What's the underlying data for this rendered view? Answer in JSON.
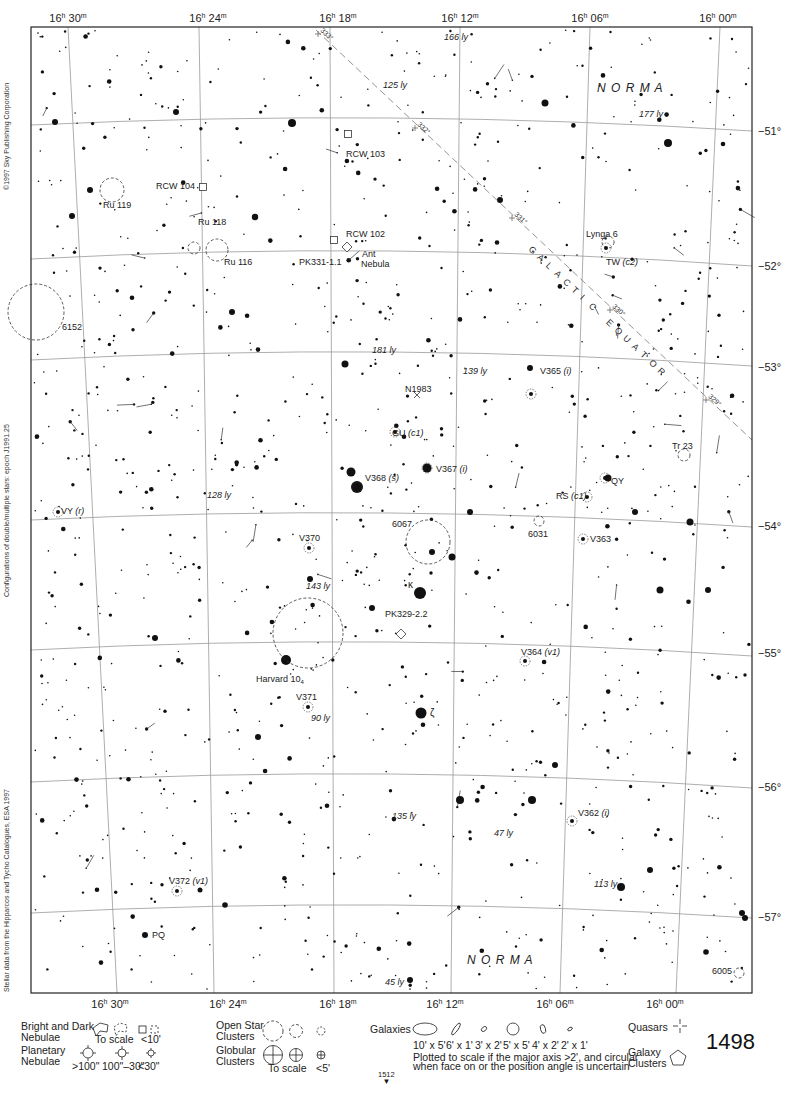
{
  "atlas": {
    "page_number": "1498",
    "adjacent_page_below": "1512",
    "side_notes": [
      "©1997 Sky Publishing Corporation",
      "Configurations of double/multiple stars: epoch J1991.25",
      "Stellar data from the Hipparcos and Tycho Catalogues, ESA 1997"
    ]
  },
  "map": {
    "frame": {
      "left": 31,
      "top": 27,
      "right": 752,
      "bottom": 993
    },
    "ra_labels_top": [
      {
        "h": "16",
        "m": "30",
        "x": 68
      },
      {
        "h": "16",
        "m": "24",
        "x": 208
      },
      {
        "h": "16",
        "m": "18",
        "x": 338
      },
      {
        "h": "16",
        "m": "12",
        "x": 460
      },
      {
        "h": "16",
        "m": "06",
        "x": 590
      },
      {
        "h": "16",
        "m": "00",
        "x": 718
      }
    ],
    "ra_labels_bottom": [
      {
        "h": "16",
        "m": "30",
        "x": 110
      },
      {
        "h": "16",
        "m": "24",
        "x": 228
      },
      {
        "h": "16",
        "m": "18",
        "x": 338
      },
      {
        "h": "16",
        "m": "12",
        "x": 445
      },
      {
        "h": "16",
        "m": "06",
        "x": 555
      },
      {
        "h": "16",
        "m": "00",
        "x": 665
      }
    ],
    "dec_labels": [
      {
        "label": "−51°",
        "y": 131
      },
      {
        "label": "−52°",
        "y": 266
      },
      {
        "label": "−53°",
        "y": 367
      },
      {
        "label": "−54°",
        "y": 526
      },
      {
        "label": "−55°",
        "y": 653
      },
      {
        "label": "−56°",
        "y": 787
      },
      {
        "label": "−57°",
        "y": 917
      }
    ],
    "ra_lines": [
      {
        "x1": 68,
        "y1": 27,
        "x2": 117,
        "y2": 993
      },
      {
        "x1": 199,
        "y1": 27,
        "x2": 214,
        "y2": 993
      },
      {
        "x1": 330,
        "y1": 27,
        "x2": 334,
        "y2": 993
      },
      {
        "x1": 460,
        "y1": 27,
        "x2": 451,
        "y2": 993
      },
      {
        "x1": 590,
        "y1": 27,
        "x2": 560,
        "y2": 993
      },
      {
        "x1": 720,
        "y1": 27,
        "x2": 676,
        "y2": 993
      }
    ],
    "dec_lines": [
      {
        "y_left": 125,
        "y_mid": 118,
        "y_right": 131
      },
      {
        "y_left": 259,
        "y_mid": 251,
        "y_right": 266
      },
      {
        "y_left": 360,
        "y_mid": 352,
        "y_right": 366
      },
      {
        "y_left": 520,
        "y_mid": 513,
        "y_right": 527
      },
      {
        "y_left": 650,
        "y_mid": 642,
        "y_right": 656
      },
      {
        "y_left": 782,
        "y_mid": 774,
        "y_right": 788
      },
      {
        "y_left": 913,
        "y_mid": 905,
        "y_right": 918
      }
    ],
    "galactic_equator": {
      "label": "GALACTIC EQUATOR",
      "x1": 316,
      "y1": 30,
      "x2": 752,
      "y2": 440,
      "ticks": [
        {
          "label": "333°",
          "x": 318,
          "y": 34
        },
        {
          "label": "332°",
          "x": 415,
          "y": 128
        },
        {
          "label": "331°",
          "x": 512,
          "y": 218
        },
        {
          "label": "330°",
          "x": 610,
          "y": 310
        },
        {
          "label": "329°",
          "x": 706,
          "y": 400
        }
      ]
    },
    "constellation_labels": [
      {
        "text": "N O R M A",
        "x": 597,
        "y": 92
      },
      {
        "text": "N O R M A",
        "x": 467,
        "y": 964
      }
    ],
    "objects": [
      {
        "type": "open-cluster",
        "name": "Ru 119",
        "x": 112,
        "y": 190,
        "r": 12,
        "lx": 103,
        "ly": 208
      },
      {
        "type": "bright-nebula",
        "name": "RCW 104",
        "x": 203,
        "y": 187,
        "lx": 156,
        "ly": 189
      },
      {
        "type": "bright-nebula",
        "name": "RCW 103",
        "x": 348,
        "y": 134,
        "lx": 346,
        "ly": 157
      },
      {
        "type": "bright-nebula",
        "name": "RCW 102",
        "x": 334,
        "y": 240,
        "lx": 346,
        "ly": 237
      },
      {
        "type": "open-cluster",
        "name": "Ru 118",
        "x": 194,
        "y": 248,
        "r": 6,
        "lx": 198,
        "ly": 225
      },
      {
        "type": "open-cluster",
        "name": "Ru 116",
        "x": 217,
        "y": 250,
        "r": 11,
        "lx": 224,
        "ly": 265
      },
      {
        "type": "planetary-nebula",
        "name": "PK331-1.1",
        "x": 347,
        "y": 247,
        "lx": 299,
        "ly": 265
      },
      {
        "type": "label",
        "name": "Ant",
        "x": 362,
        "y": 257,
        "lx": 362,
        "ly": 257
      },
      {
        "type": "label",
        "name": "Nebula",
        "x": 361,
        "y": 267,
        "lx": 361,
        "ly": 267
      },
      {
        "type": "open-cluster",
        "name": "6152",
        "x": 36,
        "y": 312,
        "r": 28,
        "lx": 62,
        "ly": 330
      },
      {
        "type": "open-cluster",
        "name": "Lynga 6",
        "x": 608,
        "y": 242,
        "r": 6,
        "lx": 586,
        "ly": 237
      },
      {
        "type": "variable-star",
        "name": "TW (c2)",
        "x": 606,
        "y": 248,
        "lx": 606,
        "ly": 265
      },
      {
        "type": "galaxy-marker",
        "name": "N1983",
        "x": 417,
        "y": 395,
        "lx": 405,
        "ly": 392
      },
      {
        "type": "variable-star",
        "name": "GU (c1)",
        "x": 395,
        "y": 432,
        "lx": 392,
        "ly": 436
      },
      {
        "type": "variable-star",
        "name": "V365 (i)",
        "x": 531,
        "y": 394,
        "lx": 540,
        "ly": 374
      },
      {
        "type": "open-cluster",
        "name": "Tr 23",
        "x": 684,
        "y": 455,
        "r": 6,
        "lx": 672,
        "ly": 449
      },
      {
        "type": "variable-star",
        "name": "V367 (i)",
        "x": 427,
        "y": 468,
        "lx": 436,
        "ly": 472
      },
      {
        "type": "variable-star",
        "name": "V368 (s)",
        "x": 357,
        "y": 487,
        "lx": 365,
        "ly": 481
      },
      {
        "type": "variable-star",
        "name": "QY",
        "x": 605,
        "y": 478,
        "lx": 611,
        "ly": 484
      },
      {
        "type": "variable-star",
        "name": "RS (c1)",
        "x": 587,
        "y": 497,
        "lx": 556,
        "ly": 499
      },
      {
        "type": "variable-star",
        "name": "VY (r)",
        "x": 58,
        "y": 512,
        "lx": 61,
        "ly": 514
      },
      {
        "type": "open-cluster",
        "name": "6067",
        "x": 428,
        "y": 542,
        "r": 22,
        "lx": 392,
        "ly": 527
      },
      {
        "type": "open-cluster",
        "name": "6031",
        "x": 539,
        "y": 521,
        "r": 5,
        "lx": 528,
        "ly": 537
      },
      {
        "type": "variable-star",
        "name": "V363",
        "x": 583,
        "y": 539,
        "lx": 590,
        "ly": 542
      },
      {
        "type": "variable-star",
        "name": "V370",
        "x": 309,
        "y": 548,
        "lx": 299,
        "ly": 541
      },
      {
        "type": "open-cluster",
        "name": "Harvard 10",
        "x": 308,
        "y": 633,
        "r": 35,
        "lx": 256,
        "ly": 682
      },
      {
        "type": "planetary-nebula",
        "name": "PK329-2.2",
        "x": 401,
        "y": 634,
        "lx": 385,
        "ly": 617
      },
      {
        "type": "variable-star",
        "name": "V364 (v1)",
        "x": 525,
        "y": 661,
        "lx": 521,
        "ly": 655
      },
      {
        "type": "variable-star",
        "name": "V371",
        "x": 308,
        "y": 707,
        "lx": 296,
        "ly": 700
      },
      {
        "type": "variable-star",
        "name": "V362 (i)",
        "x": 572,
        "y": 821,
        "lx": 578,
        "ly": 816
      },
      {
        "type": "variable-star",
        "name": "V372 (v1)",
        "x": 177,
        "y": 891,
        "lx": 169,
        "ly": 884
      },
      {
        "type": "label",
        "name": "PQ",
        "x": 145,
        "y": 935,
        "lx": 152,
        "ly": 938
      },
      {
        "type": "open-cluster",
        "name": "6005",
        "x": 739,
        "y": 973,
        "r": 5,
        "lx": 712,
        "ly": 974
      }
    ],
    "greek_labels": [
      {
        "text": "κ",
        "x": 408,
        "y": 588
      },
      {
        "text": "ζ",
        "x": 430,
        "y": 716
      }
    ],
    "distance_labels": [
      {
        "text": "166 ly",
        "x": 444,
        "y": 40
      },
      {
        "text": "125 ly",
        "x": 383,
        "y": 88
      },
      {
        "text": "177 ly",
        "x": 639,
        "y": 117
      },
      {
        "text": "181 ly",
        "x": 372,
        "y": 353
      },
      {
        "text": "139 ly",
        "x": 463,
        "y": 374
      },
      {
        "text": "128 ly",
        "x": 207,
        "y": 498
      },
      {
        "text": "143 ly",
        "x": 306,
        "y": 589
      },
      {
        "text": "90 ly",
        "x": 311,
        "y": 721
      },
      {
        "text": "135 ly",
        "x": 392,
        "y": 819
      },
      {
        "text": "47 ly",
        "x": 494,
        "y": 836
      },
      {
        "text": "113 ly",
        "x": 594,
        "y": 887
      },
      {
        "text": "45 ly",
        "x": 385,
        "y": 985
      }
    ],
    "bright_stars": [
      {
        "x": 357,
        "y": 487,
        "r": 6
      },
      {
        "x": 420,
        "y": 593,
        "r": 6
      },
      {
        "x": 421,
        "y": 713,
        "r": 5.5
      },
      {
        "x": 286,
        "y": 660,
        "r": 5
      },
      {
        "x": 351,
        "y": 472,
        "r": 4.5
      },
      {
        "x": 427,
        "y": 468,
        "r": 4.5
      },
      {
        "x": 668,
        "y": 143,
        "r": 4
      },
      {
        "x": 292,
        "y": 123,
        "r": 4
      },
      {
        "x": 460,
        "y": 800,
        "r": 4
      },
      {
        "x": 532,
        "y": 800,
        "r": 4
      },
      {
        "x": 621,
        "y": 887,
        "r": 4
      },
      {
        "x": 345,
        "y": 364,
        "r": 3.5
      },
      {
        "x": 255,
        "y": 217,
        "r": 3.2
      },
      {
        "x": 90,
        "y": 190,
        "r": 3
      },
      {
        "x": 72,
        "y": 216,
        "r": 3
      },
      {
        "x": 660,
        "y": 590,
        "r": 3.5
      },
      {
        "x": 708,
        "y": 590,
        "r": 3
      },
      {
        "x": 635,
        "y": 512,
        "r": 3
      },
      {
        "x": 55,
        "y": 122,
        "r": 3
      },
      {
        "x": 232,
        "y": 312,
        "r": 3
      },
      {
        "x": 176,
        "y": 112,
        "r": 3
      },
      {
        "x": 545,
        "y": 103,
        "r": 3.5
      },
      {
        "x": 500,
        "y": 200,
        "r": 3
      },
      {
        "x": 155,
        "y": 638,
        "r": 3
      },
      {
        "x": 372,
        "y": 608,
        "r": 3
      },
      {
        "x": 690,
        "y": 522,
        "r": 3.5
      },
      {
        "x": 608,
        "y": 478,
        "r": 3.5
      },
      {
        "x": 258,
        "y": 737,
        "r": 3
      },
      {
        "x": 555,
        "y": 765,
        "r": 3
      },
      {
        "x": 706,
        "y": 952,
        "r": 2.8
      },
      {
        "x": 650,
        "y": 870,
        "r": 3
      },
      {
        "x": 225,
        "y": 905,
        "r": 2.8
      },
      {
        "x": 200,
        "y": 890,
        "r": 2.5
      },
      {
        "x": 530,
        "y": 368,
        "r": 3
      },
      {
        "x": 470,
        "y": 512,
        "r": 3
      },
      {
        "x": 452,
        "y": 557,
        "r": 3.5
      },
      {
        "x": 432,
        "y": 552,
        "r": 3
      },
      {
        "x": 742,
        "y": 913,
        "r": 3
      },
      {
        "x": 745,
        "y": 918,
        "r": 3
      },
      {
        "x": 310,
        "y": 579,
        "r": 3
      },
      {
        "x": 145,
        "y": 935,
        "r": 3
      },
      {
        "x": 410,
        "y": 980,
        "r": 3
      }
    ],
    "star_seed": 1498,
    "star_count": 1150
  },
  "legend": {
    "nebulae": {
      "title_line1": "Bright and Dark",
      "title_line2": "Nebulae",
      "to_scale": "To scale",
      "small": "<10'"
    },
    "planetary": {
      "title_line1": "Planetary",
      "title_line2": "Nebulae",
      "sizes": [
        ">100\"",
        "100\"–30\"",
        "<30\""
      ]
    },
    "open_clusters": {
      "title_line1": "Open Star",
      "title_line2": "Clusters"
    },
    "globular_clusters": {
      "title_line1": "Globular",
      "title_line2": "Clusters",
      "to_scale": "To scale",
      "small": "<5'"
    },
    "galaxies": {
      "title": "Galaxies",
      "sizes": [
        "10' x 5'",
        "6' x 1'",
        "3' x 2'",
        "5' x 5'",
        "4' x 2'",
        "2' x 1'"
      ],
      "note_line1": "Plotted to scale if the major axis >2', and circular",
      "note_line2": "when face on or the position angle is uncertain"
    },
    "quasars": {
      "title": "Quasars"
    },
    "galaxy_clusters": {
      "title_line1": "Galaxy",
      "title_line2": "Clusters"
    }
  }
}
